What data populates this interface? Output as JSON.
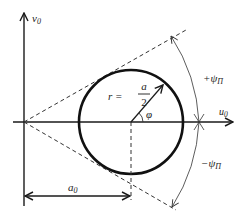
{
  "diagram": {
    "type": "geometric-construction",
    "colors": {
      "background": "#ffffff",
      "ink": "#1a1a1a",
      "thin": "#333333"
    },
    "axes": {
      "vertical_label": "v",
      "vertical_sub": "0",
      "horizontal_label": "u",
      "horizontal_sub": "0"
    },
    "circle": {
      "radius_label_prefix": "r =",
      "radius_num": "a",
      "radius_den": "2",
      "angle_label": "φ"
    },
    "angles": {
      "upper_label": "+ψ",
      "upper_sub": "П",
      "lower_label": "−ψ",
      "lower_sub": "П"
    },
    "dimension": {
      "label": "a",
      "label_sub": "0"
    }
  }
}
